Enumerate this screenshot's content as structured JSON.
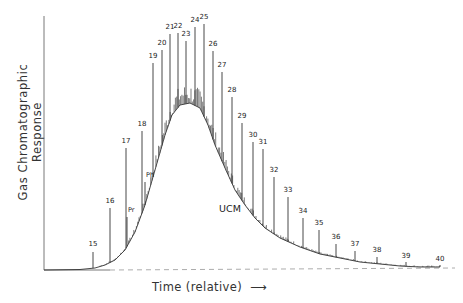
{
  "chart_data": {
    "type": "line",
    "title": "",
    "xlabel": "Time (relative)",
    "xlabel_arrow": "⟶",
    "ylabel": "Gas Chromatographic Response",
    "grid": false,
    "legend": null,
    "annotations": [
      {
        "text": "UCM",
        "x": 230,
        "y": 212,
        "meaning": "Unresolved Complex Mixture hump"
      }
    ],
    "baseline_style": "dashed",
    "peaks": [
      {
        "label": "15",
        "x": 93,
        "top": 252,
        "label_y": 246
      },
      {
        "label": "16",
        "x": 110,
        "top": 208,
        "label_y": 203
      },
      {
        "label": "17",
        "x": 126,
        "top": 148,
        "label_y": 143
      },
      {
        "label": "Pr",
        "x": 127,
        "top": 217,
        "label_y": 212,
        "small": true
      },
      {
        "label": "18",
        "x": 142,
        "top": 131,
        "label_y": 126
      },
      {
        "label": "Ph",
        "x": 145,
        "top": 182,
        "label_y": 177,
        "small": true
      },
      {
        "label": "19",
        "x": 153,
        "top": 63,
        "label_y": 58
      },
      {
        "label": "20",
        "x": 162,
        "top": 50,
        "label_y": 45
      },
      {
        "label": "21",
        "x": 170,
        "top": 34,
        "label_y": 29
      },
      {
        "label": "22",
        "x": 178,
        "top": 33,
        "label_y": 28
      },
      {
        "label": "23",
        "x": 186,
        "top": 41,
        "label_y": 36
      },
      {
        "label": "24",
        "x": 195,
        "top": 27,
        "label_y": 22
      },
      {
        "label": "25",
        "x": 204,
        "top": 24,
        "label_y": 19
      },
      {
        "label": "26",
        "x": 213,
        "top": 51,
        "label_y": 46
      },
      {
        "label": "27",
        "x": 222,
        "top": 72,
        "label_y": 67
      },
      {
        "label": "28",
        "x": 232,
        "top": 97,
        "label_y": 92
      },
      {
        "label": "29",
        "x": 242,
        "top": 123,
        "label_y": 118
      },
      {
        "label": "30",
        "x": 253,
        "top": 142,
        "label_y": 137
      },
      {
        "label": "31",
        "x": 263,
        "top": 149,
        "label_y": 144
      },
      {
        "label": "32",
        "x": 274,
        "top": 177,
        "label_y": 172
      },
      {
        "label": "33",
        "x": 288,
        "top": 197,
        "label_y": 192
      },
      {
        "label": "34",
        "x": 303,
        "top": 218,
        "label_y": 213
      },
      {
        "label": "35",
        "x": 319,
        "top": 230,
        "label_y": 225
      },
      {
        "label": "36",
        "x": 336,
        "top": 244,
        "label_y": 239
      },
      {
        "label": "37",
        "x": 355,
        "top": 251,
        "label_y": 246
      },
      {
        "label": "38",
        "x": 377,
        "top": 257,
        "label_y": 252
      },
      {
        "label": "39",
        "x": 406,
        "top": 262,
        "label_y": 258
      },
      {
        "label": "40",
        "x": 440,
        "top": 265,
        "label_y": 261
      }
    ],
    "envelope": [
      [
        44,
        270
      ],
      [
        80,
        269.5
      ],
      [
        95,
        268
      ],
      [
        105,
        265
      ],
      [
        115,
        260
      ],
      [
        125,
        250
      ],
      [
        135,
        232
      ],
      [
        145,
        205
      ],
      [
        155,
        170
      ],
      [
        165,
        135
      ],
      [
        172,
        115
      ],
      [
        180,
        105
      ],
      [
        190,
        103
      ],
      [
        200,
        108
      ],
      [
        208,
        125
      ],
      [
        215,
        145
      ],
      [
        225,
        168
      ],
      [
        235,
        190
      ],
      [
        245,
        205
      ],
      [
        255,
        218
      ],
      [
        265,
        228
      ],
      [
        280,
        238
      ],
      [
        300,
        247
      ],
      [
        320,
        254
      ],
      [
        340,
        258
      ],
      [
        360,
        262
      ],
      [
        380,
        264
      ],
      [
        400,
        266
      ],
      [
        420,
        267
      ],
      [
        440,
        267
      ]
    ],
    "axes": {
      "x0": 44,
      "y_top": 16,
      "y_bottom": 270,
      "x_end": 455
    }
  }
}
